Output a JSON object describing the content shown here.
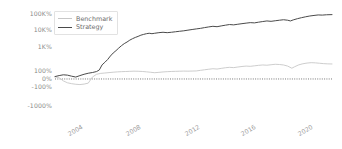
{
  "chart_data": {
    "type": "line",
    "title": "",
    "xlabel": "",
    "ylabel": "",
    "yscale": "symlog-percent",
    "grid": false,
    "legend_position": "upper-left",
    "zero_reference_line": {
      "value": "0%",
      "style": "dotted",
      "color": "#555555"
    },
    "y_ticks": [
      {
        "label": "100K%",
        "value": 100000,
        "pos_pct": 7.5
      },
      {
        "label": "10K%",
        "value": 10000,
        "pos_pct": 22.9
      },
      {
        "label": "1K%",
        "value": 1000,
        "pos_pct": 38.3
      },
      {
        "label": "100%",
        "value": 100,
        "pos_pct": 60.7
      },
      {
        "label": "0%",
        "value": 0,
        "pos_pct": 68.2
      },
      {
        "label": "-100%",
        "value": -100,
        "pos_pct": 75.7
      },
      {
        "label": "-1000%",
        "value": -1000,
        "pos_pct": 93.5
      }
    ],
    "x_ticks": [
      {
        "label": "2004",
        "pos_pct": 8.0
      },
      {
        "label": "2008",
        "pos_pct": 29.0
      },
      {
        "label": "2012",
        "pos_pct": 50.0
      },
      {
        "label": "2016",
        "pos_pct": 70.5
      },
      {
        "label": "2020",
        "pos_pct": 91.0
      }
    ],
    "xlim": [
      "2001",
      "2023"
    ],
    "series": [
      {
        "name": "Benchmark",
        "color": "#c7c7c7",
        "width": 0.9,
        "points": [
          [
            0.0,
            2.5
          ],
          [
            1.5,
            1.0
          ],
          [
            3.0,
            -2.0
          ],
          [
            4.5,
            -8.0
          ],
          [
            6.0,
            -14.0
          ],
          [
            7.5,
            -20.0
          ],
          [
            9.0,
            -24.0
          ],
          [
            10.5,
            -18.0
          ],
          [
            12.0,
            -10.0
          ],
          [
            13.5,
            2.0
          ],
          [
            15.0,
            14.0
          ],
          [
            16.5,
            24.0
          ],
          [
            18.0,
            30.0
          ],
          [
            19.5,
            38.0
          ],
          [
            21.0,
            48.0
          ],
          [
            22.5,
            58.0
          ],
          [
            24.0,
            66.0
          ],
          [
            25.5,
            72.0
          ],
          [
            27.0,
            80.0
          ],
          [
            28.5,
            88.0
          ],
          [
            30.0,
            84.0
          ],
          [
            31.5,
            74.0
          ],
          [
            33.0,
            60.0
          ],
          [
            34.5,
            46.0
          ],
          [
            36.0,
            36.0
          ],
          [
            37.5,
            44.0
          ],
          [
            39.0,
            56.0
          ],
          [
            40.5,
            66.0
          ],
          [
            42.0,
            74.0
          ],
          [
            43.5,
            80.0
          ],
          [
            45.0,
            86.0
          ],
          [
            46.5,
            92.0
          ],
          [
            48.0,
            88.0
          ],
          [
            49.5,
            94.0
          ],
          [
            51.0,
            100.0
          ],
          [
            52.5,
            106.0
          ],
          [
            54.0,
            112.0
          ],
          [
            55.5,
            118.0
          ],
          [
            57.0,
            124.0
          ],
          [
            58.5,
            120.0
          ],
          [
            60.0,
            128.0
          ],
          [
            61.5,
            136.0
          ],
          [
            63.0,
            142.0
          ],
          [
            64.5,
            138.0
          ],
          [
            66.0,
            146.0
          ],
          [
            67.5,
            154.0
          ],
          [
            69.0,
            160.0
          ],
          [
            70.5,
            156.0
          ],
          [
            72.0,
            164.0
          ],
          [
            73.5,
            172.0
          ],
          [
            75.0,
            178.0
          ],
          [
            76.5,
            174.0
          ],
          [
            78.0,
            182.0
          ],
          [
            79.5,
            190.0
          ],
          [
            81.0,
            186.0
          ],
          [
            82.5,
            178.0
          ],
          [
            84.0,
            160.0
          ],
          [
            85.5,
            130.0
          ],
          [
            86.5,
            150.0
          ],
          [
            88.0,
            180.0
          ],
          [
            89.5,
            200.0
          ],
          [
            91.0,
            214.0
          ],
          [
            92.5,
            222.0
          ],
          [
            94.0,
            218.0
          ],
          [
            95.5,
            210.0
          ],
          [
            97.0,
            202.0
          ],
          [
            98.5,
            198.0
          ],
          [
            100.0,
            196.0
          ]
        ]
      },
      {
        "name": "Strategy",
        "color": "#4a4a4a",
        "width": 1.0,
        "points": [
          [
            0.0,
            3.0
          ],
          [
            1.5,
            6.0
          ],
          [
            3.0,
            10.0
          ],
          [
            4.5,
            8.0
          ],
          [
            6.0,
            4.0
          ],
          [
            7.5,
            2.0
          ],
          [
            9.0,
            6.0
          ],
          [
            10.5,
            14.0
          ],
          [
            12.0,
            26.0
          ],
          [
            13.5,
            40.0
          ],
          [
            15.0,
            70.0
          ],
          [
            16.0,
            110.0
          ],
          [
            17.0,
            180.0
          ],
          [
            18.0,
            230.0
          ],
          [
            19.0,
            300.0
          ],
          [
            20.0,
            420.0
          ],
          [
            21.0,
            560.0
          ],
          [
            22.0,
            700.0
          ],
          [
            23.0,
            900.0
          ],
          [
            24.0,
            1200.0
          ],
          [
            25.0,
            1600.0
          ],
          [
            26.0,
            2000.0
          ],
          [
            27.0,
            2600.0
          ],
          [
            28.0,
            3200.0
          ],
          [
            29.0,
            3800.0
          ],
          [
            30.0,
            4400.0
          ],
          [
            31.0,
            5200.0
          ],
          [
            32.0,
            5800.0
          ],
          [
            33.0,
            6400.0
          ],
          [
            34.0,
            6800.0
          ],
          [
            35.0,
            6400.0
          ],
          [
            36.0,
            6800.0
          ],
          [
            37.5,
            7400.0
          ],
          [
            39.0,
            7800.0
          ],
          [
            40.5,
            7400.0
          ],
          [
            42.0,
            7800.0
          ],
          [
            43.5,
            8400.0
          ],
          [
            45.0,
            9000.0
          ],
          [
            46.5,
            9600.0
          ],
          [
            48.0,
            10500.0
          ],
          [
            49.5,
            11500.0
          ],
          [
            51.0,
            12500.0
          ],
          [
            52.5,
            13500.0
          ],
          [
            54.0,
            15000.0
          ],
          [
            55.5,
            16500.0
          ],
          [
            57.0,
            18000.0
          ],
          [
            58.5,
            17000.0
          ],
          [
            60.0,
            19000.0
          ],
          [
            61.5,
            21000.0
          ],
          [
            63.0,
            23000.0
          ],
          [
            64.5,
            22000.0
          ],
          [
            66.0,
            24000.0
          ],
          [
            67.5,
            26000.0
          ],
          [
            69.0,
            28000.0
          ],
          [
            70.5,
            30000.0
          ],
          [
            72.0,
            29000.0
          ],
          [
            73.5,
            32000.0
          ],
          [
            75.0,
            35000.0
          ],
          [
            76.5,
            38000.0
          ],
          [
            78.0,
            36000.0
          ],
          [
            79.5,
            39000.0
          ],
          [
            81.0,
            42000.0
          ],
          [
            82.5,
            45000.0
          ],
          [
            84.0,
            42000.0
          ],
          [
            85.0,
            38000.0
          ],
          [
            86.0,
            44000.0
          ],
          [
            87.5,
            52000.0
          ],
          [
            89.0,
            60000.0
          ],
          [
            90.5,
            68000.0
          ],
          [
            92.0,
            76000.0
          ],
          [
            93.5,
            82000.0
          ],
          [
            95.0,
            88000.0
          ],
          [
            96.5,
            86000.0
          ],
          [
            98.0,
            90000.0
          ],
          [
            100.0,
            92000.0
          ]
        ]
      }
    ]
  },
  "legend": {
    "items": [
      {
        "label": "Benchmark",
        "color": "#c7c7c7"
      },
      {
        "label": "Strategy",
        "color": "#4a4a4a"
      }
    ]
  }
}
